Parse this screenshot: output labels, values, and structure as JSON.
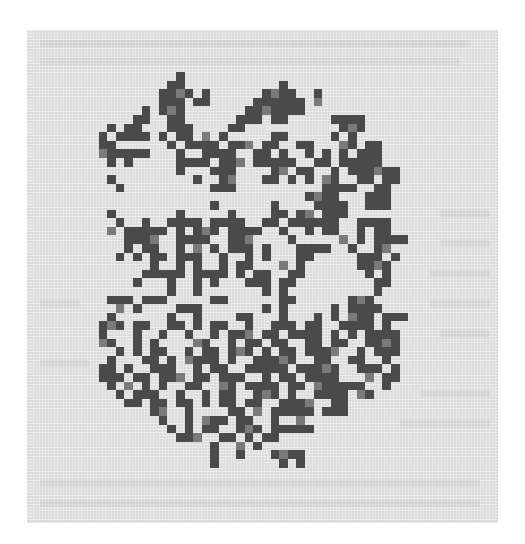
{
  "figure": {
    "colors": {
      "page": "#ffffff",
      "panel": "#e6e6e6",
      "cell": "#4a4a4a",
      "cell_light": "#7a7a7a"
    },
    "grid": {
      "origin_x": 90,
      "origin_y": 72,
      "cell_size": 8.6,
      "cols": 38,
      "rows": 46
    },
    "rows": [
      "..........#...........................",
      ".........##...........#...............",
      "........####.#......####..#...........",
      "........###.##.....######.#...........",
      "......#.###.......#######.............",
      ".....##..##......###.##.....####......",
      "..#.##...###....##...........###......",
      ".#.####.#.##.#.#.....##.....#.#.......",
      ".##......#.####.###.##..##...##.##....",
      ".######...#..####..##.#..#.#.#.###....",
      "..#.#.....####.###.#####..##.#####....",
      "..........#...###....##.##..#.######..",
      "..#.........#..##...##.#.#.##..##.##..",
      "...#..........###..........####..##...",
      ".........................####...###...",
      "..............#......#....####..###...",
      "..#.......#.....#....##.##.###........",
      "...#..#..####.####..##.######..####...",
      "..#.#####.#.###.####..#..#.##..#.##...",
      "....####..####..###....#.....#.#.####.",
      "....#.##..#.#.#.###.#...####..#..##...",
      "...#.#.##.###..#..#.#...##.....###.#..",
      ".......#..#.#..#.##...#.#......####...",
      "......#####.####.#.##..##.......#.#...",
      ".....#...#..#.#...###.##.........##...",
      ".........#..#.......#.#..........#....",
      "..###.###.....##......##......###.....",
      "...#.#....###.......#.#.....#.####....",
      "..#......#..#....##...#...#.#.###.###.",
      ".###.##..##.#.##..#..###.##..####.#...",
      ".#...#..#..#..#.###.##.####.#.#.####..",
      ".##..#.#....##..#.##.##..##.##..####..",
      "...#.#.##..#.##.###.#.##.####..#.###..",
      "..#...##.#.####.#..#####..##..##..#...",
      ".##.#..###..#.##..#####.#####..###.#..",
      ".###.##.###.##.###..#.##.####...#.##..",
      "..#.#.#.#..##..##.####.##.######..#...",
      "...#.###..#..#.##..###.#..####.##.....",
      "....##.##.##.#.##.##..####..##........",
      ".......##..#....##.#.#####.###........",
      "........#..#.###.##..#..#.............",
      ".........#.#.##..###.#####............",
      "..........###..##.#.##................",
      "..............#..#.#..................",
      "..............#..#...####.............",
      "..............#.......#.#............."
    ],
    "ghost_text_lines": [
      {
        "x": 40,
        "y": 40,
        "w": 430
      },
      {
        "x": 40,
        "y": 58,
        "w": 420
      },
      {
        "x": 440,
        "y": 210,
        "w": 50
      },
      {
        "x": 440,
        "y": 240,
        "w": 50
      },
      {
        "x": 430,
        "y": 270,
        "w": 60
      },
      {
        "x": 430,
        "y": 300,
        "w": 60
      },
      {
        "x": 40,
        "y": 300,
        "w": 40
      },
      {
        "x": 440,
        "y": 330,
        "w": 50
      },
      {
        "x": 40,
        "y": 360,
        "w": 50
      },
      {
        "x": 420,
        "y": 390,
        "w": 70
      },
      {
        "x": 400,
        "y": 420,
        "w": 90
      },
      {
        "x": 40,
        "y": 480,
        "w": 440
      },
      {
        "x": 40,
        "y": 500,
        "w": 440
      }
    ]
  }
}
